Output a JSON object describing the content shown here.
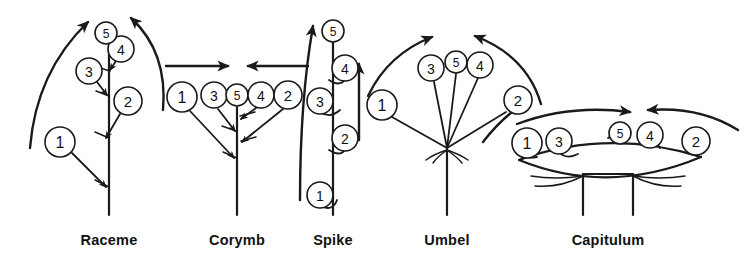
{
  "figure": {
    "background_color": "#ffffff",
    "ink_color": "#1a1a1a"
  },
  "inflorescences": [
    {
      "name": "raceme",
      "label": "Raceme",
      "label_x": 109,
      "label_y": 232,
      "axis_x": 109,
      "sequence_direction": "acropetal",
      "markers": [
        {
          "number": "1",
          "cx": 60,
          "cy": 142,
          "r": 15,
          "tip_x": 105,
          "tip_y": 187
        },
        {
          "number": "2",
          "cx": 128,
          "cy": 101,
          "r": 14,
          "tip_x": 106,
          "tip_y": 138
        },
        {
          "number": "3",
          "cx": 89,
          "cy": 71,
          "r": 13,
          "tip_x": 108,
          "tip_y": 96
        },
        {
          "number": "4",
          "cx": 121,
          "cy": 49,
          "r": 13,
          "tip_x": 110,
          "tip_y": 71
        },
        {
          "number": "5",
          "cx": 106,
          "cy": 33,
          "r": 11,
          "tip_x": 109,
          "tip_y": 45
        }
      ]
    },
    {
      "name": "corymb",
      "label": "Corymb",
      "label_x": 237,
      "label_y": 232,
      "axis_x": 237,
      "sequence_direction": "convergent",
      "markers": [
        {
          "number": "1",
          "cx": 182,
          "cy": 97,
          "r": 15,
          "tip_x": 234,
          "tip_y": 158
        },
        {
          "number": "3",
          "cx": 214,
          "cy": 95,
          "r": 13,
          "tip_x": 235,
          "tip_y": 131
        },
        {
          "number": "5",
          "cx": 237,
          "cy": 95,
          "r": 11,
          "tip_x": 237,
          "tip_y": 112
        },
        {
          "number": "4",
          "cx": 261,
          "cy": 95,
          "r": 13,
          "tip_x": 241,
          "tip_y": 115
        },
        {
          "number": "2",
          "cx": 288,
          "cy": 95,
          "r": 14,
          "tip_x": 241,
          "tip_y": 141
        }
      ]
    },
    {
      "name": "spike",
      "label": "Spike",
      "label_x": 333,
      "label_y": 232,
      "axis_x": 333,
      "sequence_direction": "acropetal",
      "markers": [
        {
          "number": "1",
          "cx": 320,
          "cy": 195,
          "r": 13
        },
        {
          "number": "2",
          "cx": 345,
          "cy": 138,
          "r": 13
        },
        {
          "number": "3",
          "cx": 320,
          "cy": 101,
          "r": 13
        },
        {
          "number": "4",
          "cx": 345,
          "cy": 68,
          "r": 13
        },
        {
          "number": "5",
          "cx": 333,
          "cy": 31,
          "r": 11
        }
      ]
    },
    {
      "name": "umbel",
      "label": "Umbel",
      "label_x": 447,
      "label_y": 232,
      "axis_x": 447,
      "sequence_direction": "convergent",
      "node_x": 447,
      "node_y": 148,
      "markers": [
        {
          "number": "1",
          "cx": 382,
          "cy": 105,
          "r": 15
        },
        {
          "number": "3",
          "cx": 431,
          "cy": 68,
          "r": 13
        },
        {
          "number": "5",
          "cx": 456,
          "cy": 62,
          "r": 11
        },
        {
          "number": "4",
          "cx": 480,
          "cy": 65,
          "r": 13
        },
        {
          "number": "2",
          "cx": 518,
          "cy": 100,
          "r": 14
        }
      ]
    },
    {
      "name": "capitulum",
      "label": "Capitulum",
      "label_x": 608,
      "label_y": 232,
      "axis_x": 608,
      "sequence_direction": "convergent",
      "markers": [
        {
          "number": "1",
          "cx": 527,
          "cy": 143,
          "r": 15
        },
        {
          "number": "3",
          "cx": 559,
          "cy": 141,
          "r": 13
        },
        {
          "number": "5",
          "cx": 620,
          "cy": 133,
          "r": 11
        },
        {
          "number": "4",
          "cx": 650,
          "cy": 135,
          "r": 13
        },
        {
          "number": "2",
          "cx": 696,
          "cy": 141,
          "r": 14
        }
      ]
    }
  ]
}
